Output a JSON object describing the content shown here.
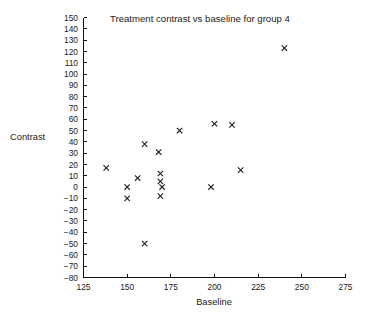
{
  "chart_data": {
    "type": "scatter",
    "title": "Treatment contrast vs baseline for group 4",
    "xlabel": "Baseline",
    "ylabel": "Contrast",
    "xlim": [
      125,
      275
    ],
    "ylim": [
      -80,
      150
    ],
    "xticks": [
      125,
      150,
      175,
      200,
      225,
      250,
      275
    ],
    "xtick_labels": [
      "125",
      "150",
      "175",
      "200",
      "225",
      "250",
      "275"
    ],
    "yticks": [
      150,
      140,
      130,
      120,
      110,
      100,
      90,
      80,
      70,
      60,
      50,
      40,
      30,
      20,
      10,
      0,
      -10,
      -20,
      -30,
      -40,
      -50,
      -60,
      -70,
      -80
    ],
    "ytick_labels": [
      "150",
      "140",
      "130",
      "120",
      "110",
      "100",
      "90",
      "80",
      "70",
      "60",
      "50",
      "40",
      "30",
      "20",
      "10",
      "0",
      "−10",
      "−20",
      "−30",
      "−40",
      "−50",
      "−60",
      "−70",
      "−80"
    ],
    "grid": false,
    "legend": null,
    "marker": "x",
    "marker_color": "#222222",
    "x": [
      138,
      150,
      150,
      156,
      160,
      160,
      168,
      169,
      169,
      169,
      170,
      180,
      198,
      200,
      210,
      215,
      240
    ],
    "y": [
      17,
      0,
      -10,
      8,
      38,
      -50,
      31,
      12,
      5,
      -8,
      0,
      50,
      0,
      56,
      55,
      15,
      123
    ],
    "points": [
      {
        "x": 138,
        "y": 17
      },
      {
        "x": 150,
        "y": 0
      },
      {
        "x": 150,
        "y": -10
      },
      {
        "x": 156,
        "y": 8
      },
      {
        "x": 160,
        "y": 38
      },
      {
        "x": 160,
        "y": -50
      },
      {
        "x": 168,
        "y": 31
      },
      {
        "x": 169,
        "y": 12
      },
      {
        "x": 169,
        "y": 5
      },
      {
        "x": 169,
        "y": -8
      },
      {
        "x": 170,
        "y": 0
      },
      {
        "x": 180,
        "y": 50
      },
      {
        "x": 198,
        "y": 0
      },
      {
        "x": 200,
        "y": 56
      },
      {
        "x": 210,
        "y": 55
      },
      {
        "x": 215,
        "y": 15
      },
      {
        "x": 240,
        "y": 123
      }
    ]
  }
}
